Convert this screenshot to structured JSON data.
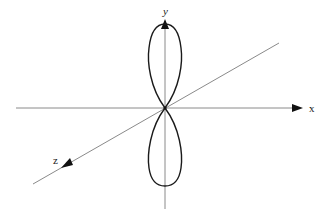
{
  "diagram": {
    "type": "3d-axes-dipole-lobes",
    "axes": {
      "x": {
        "label": "x",
        "direction": "right"
      },
      "y": {
        "label": "y",
        "direction": "up"
      },
      "z": {
        "label": "z",
        "direction": "toward viewer (lower-left)"
      }
    },
    "lobes": [
      {
        "name": "upper-lobe",
        "direction": "+y"
      },
      {
        "name": "lower-lobe",
        "direction": "-y"
      }
    ],
    "colors": {
      "axis": "#8a8a8a",
      "lobe": "#1a1a1a",
      "arrow": "#111111",
      "background": "#ffffff"
    }
  }
}
